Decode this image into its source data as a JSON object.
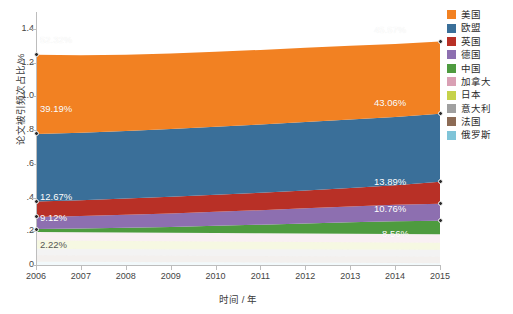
{
  "chart_data": {
    "type": "area",
    "stacked": true,
    "title": "",
    "xlabel": "时间 / 年",
    "ylabel": "论文被引频次占比/%",
    "categories": [
      "2006",
      "2007",
      "2008",
      "2009",
      "2010",
      "2011",
      "2012",
      "2013",
      "2014",
      "2015"
    ],
    "x": [
      2006,
      2007,
      2008,
      2009,
      2010,
      2011,
      2012,
      2013,
      2014,
      2015
    ],
    "xlim": [
      2006,
      2015
    ],
    "ylim": [
      0,
      1.5
    ],
    "yticks": [
      "0",
      ".2",
      ".4",
      ".6",
      ".8",
      "1.0",
      "1.2",
      "1.4"
    ],
    "ytick_values": [
      0,
      0.2,
      0.4,
      0.6,
      0.8,
      1.0,
      1.2,
      1.4
    ],
    "grid": false,
    "legend_position": "right",
    "series": [
      {
        "name": "美国",
        "color": "#F28122",
        "values": [
          0.47,
          0.46,
          0.452,
          0.448,
          0.445,
          0.442,
          0.44,
          0.437,
          0.432,
          0.428
        ]
      },
      {
        "name": "欧盟",
        "color": "#3A6F99",
        "values": [
          0.4,
          0.4,
          0.401,
          0.402,
          0.404,
          0.405,
          0.406,
          0.406,
          0.405,
          0.404
        ]
      },
      {
        "name": "英国",
        "color": "#B83026",
        "values": [
          0.092,
          0.094,
          0.096,
          0.098,
          0.1,
          0.103,
          0.106,
          0.11,
          0.116,
          0.13
        ]
      },
      {
        "name": "德国",
        "color": "#8D6FB0",
        "values": [
          0.072,
          0.074,
          0.077,
          0.08,
          0.083,
          0.086,
          0.09,
          0.094,
          0.098,
          0.101
        ]
      },
      {
        "name": "中国",
        "color": "#4E9B3F",
        "values": [
          0.017,
          0.022,
          0.028,
          0.035,
          0.043,
          0.051,
          0.059,
          0.068,
          0.075,
          0.08
        ]
      },
      {
        "name": "加拿大",
        "color": "#D9A0B4",
        "values": [
          0.05,
          0.05,
          0.05,
          0.05,
          0.05,
          0.05,
          0.05,
          0.05,
          0.05,
          0.05
        ]
      },
      {
        "name": "日本",
        "color": "#C6D24A",
        "values": [
          0.05,
          0.049,
          0.048,
          0.047,
          0.046,
          0.045,
          0.044,
          0.043,
          0.042,
          0.041
        ]
      },
      {
        "name": "意大利",
        "color": "#A0A0A0",
        "values": [
          0.038,
          0.038,
          0.039,
          0.039,
          0.04,
          0.04,
          0.041,
          0.041,
          0.042,
          0.042
        ]
      },
      {
        "name": "法国",
        "color": "#8C6B55",
        "values": [
          0.038,
          0.038,
          0.038,
          0.038,
          0.038,
          0.038,
          0.038,
          0.038,
          0.038,
          0.038
        ]
      },
      {
        "name": "俄罗斯",
        "color": "#7FC4D8",
        "values": [
          0.02,
          0.019,
          0.018,
          0.017,
          0.016,
          0.015,
          0.014,
          0.013,
          0.012,
          0.011
        ]
      }
    ],
    "annotations": [
      {
        "text": "52.32%",
        "series": "美国",
        "x": 2006,
        "side": "left"
      },
      {
        "text": "39.19%",
        "series": "欧盟",
        "x": 2006,
        "side": "left"
      },
      {
        "text": "12.67%",
        "series": "英国",
        "x": 2006,
        "side": "left"
      },
      {
        "text": "9.12%",
        "series": "德国",
        "x": 2006,
        "side": "left"
      },
      {
        "text": "2.22%",
        "series": "中国",
        "x": 2006,
        "side": "left"
      },
      {
        "text": "45.57%",
        "series": "美国",
        "x": 2015,
        "side": "right"
      },
      {
        "text": "43.06%",
        "series": "欧盟",
        "x": 2015,
        "side": "right"
      },
      {
        "text": "13.89%",
        "series": "英国",
        "x": 2015,
        "side": "right"
      },
      {
        "text": "10.76%",
        "series": "德国",
        "x": 2015,
        "side": "right"
      },
      {
        "text": "8.56%",
        "series": "中国",
        "x": 2015,
        "side": "right"
      }
    ]
  },
  "axes": {
    "ylabel": "论文被引频次占比/%",
    "xlabel": "时间 / 年",
    "ytick_labels": [
      "1.4",
      "1.2",
      "1.0",
      ".8",
      ".6",
      ".4",
      ".2",
      "0"
    ],
    "xtick_labels": [
      "2006",
      "2007",
      "2008",
      "2009",
      "2010",
      "2011",
      "2012",
      "2013",
      "2014",
      "2015"
    ]
  },
  "legend": {
    "items": [
      {
        "label": "美国",
        "color": "#F28122"
      },
      {
        "label": "欧盟",
        "color": "#3A6F99"
      },
      {
        "label": "英国",
        "color": "#B83026"
      },
      {
        "label": "德国",
        "color": "#8D6FB0"
      },
      {
        "label": "中国",
        "color": "#4E9B3F"
      },
      {
        "label": "加拿大",
        "color": "#D9A0B4"
      },
      {
        "label": "日本",
        "color": "#C6D24A"
      },
      {
        "label": "意大利",
        "color": "#A0A0A0"
      },
      {
        "label": "法国",
        "color": "#8C6B55"
      },
      {
        "label": "俄罗斯",
        "color": "#7FC4D8"
      }
    ]
  },
  "labels": {
    "left": [
      {
        "text": "52.32%",
        "top": 34,
        "left": 40,
        "style": "light"
      },
      {
        "text": "39.19%",
        "top": 103,
        "left": 40,
        "style": "light"
      },
      {
        "text": "12.67%",
        "top": 191,
        "left": 40,
        "style": "light"
      },
      {
        "text": "9.12%",
        "top": 212,
        "left": 40,
        "style": "light"
      },
      {
        "text": "2.22%",
        "top": 239,
        "left": 40,
        "style": "dark"
      }
    ],
    "right": [
      {
        "text": "45.57%",
        "top": 24,
        "left": 374,
        "style": "light"
      },
      {
        "text": "43.06%",
        "top": 97,
        "left": 374,
        "style": "light"
      },
      {
        "text": "13.89%",
        "top": 176,
        "left": 374,
        "style": "light"
      },
      {
        "text": "10.76%",
        "top": 203,
        "left": 374,
        "style": "light"
      },
      {
        "text": "8.56%",
        "top": 228,
        "left": 382,
        "style": "light"
      }
    ]
  }
}
